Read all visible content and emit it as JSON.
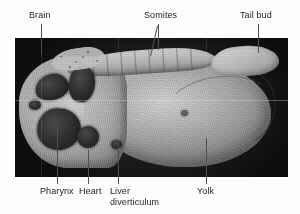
{
  "figure": {
    "caption": "",
    "background_color": "#fdfdfd",
    "panel": {
      "name": "embryo-micrograph",
      "description": "Scanning electron micrograph of a sagittally sectioned vertebrate embryo",
      "border_color": "#141414",
      "x": 15,
      "y": 38,
      "width": 273,
      "height": 139
    }
  },
  "labels": [
    {
      "id": "brain",
      "text": "Brain",
      "x": 29,
      "y": 10,
      "align": "left"
    },
    {
      "id": "somites",
      "text": "Somites",
      "x": 144,
      "y": 10,
      "align": "left"
    },
    {
      "id": "tail-bud",
      "text": "Tail bud",
      "x": 240,
      "y": 10,
      "align": "left"
    },
    {
      "id": "pharynx",
      "text": "Pharynx",
      "x": 40,
      "y": 186,
      "align": "left"
    },
    {
      "id": "heart",
      "text": "Heart",
      "x": 79,
      "y": 186,
      "align": "left"
    },
    {
      "id": "liver-diverticulum",
      "text": "Liver\ndiverticulum",
      "x": 110,
      "y": 186,
      "align": "left"
    },
    {
      "id": "yolk",
      "text": "Yolk",
      "x": 197,
      "y": 186,
      "align": "left"
    }
  ],
  "leaders": [
    {
      "id": "brain-leader",
      "type": "vertical",
      "x": 41,
      "y": 24,
      "length": 30
    },
    {
      "id": "somites-leader-a",
      "type": "vertical",
      "x": 158,
      "y": 24,
      "length": 26
    },
    {
      "id": "somites-leader-b",
      "type": "diagonal",
      "x": 158,
      "y": 26,
      "x2": 151,
      "y2": 56
    },
    {
      "id": "tail-bud-leader",
      "type": "vertical",
      "x": 258,
      "y": 24,
      "length": 29
    },
    {
      "id": "pharynx-leader",
      "type": "vertical",
      "x": 57,
      "y": 128,
      "length": 56
    },
    {
      "id": "heart-leader",
      "type": "vertical",
      "x": 88,
      "y": 150,
      "length": 34
    },
    {
      "id": "liver-leader",
      "type": "vertical",
      "x": 118,
      "y": 146,
      "length": 38
    },
    {
      "id": "yolk-leader",
      "type": "vertical",
      "x": 206,
      "y": 138,
      "length": 46
    }
  ],
  "anatomy": {
    "structures": [
      "Brain",
      "Somites",
      "Tail bud",
      "Pharynx",
      "Heart",
      "Liver diverticulum",
      "Yolk"
    ],
    "colors": {
      "tissue_light": "#d9d9d9",
      "tissue_mid": "#b2b2b2",
      "tissue_dark": "#8a8a8a",
      "cavity": "#2a2a2a",
      "background": "#141414",
      "label_text": "#1c1c1c",
      "leader_line": "#4f4f4f"
    }
  }
}
